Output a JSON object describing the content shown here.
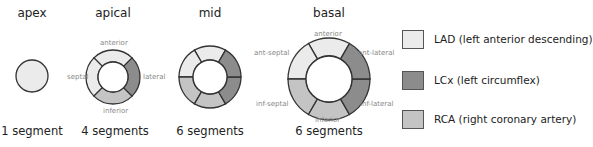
{
  "colors": {
    "LAD": "#ebebeb",
    "LCx": "#8c8c8c",
    "RCA": "#c4c4c4",
    "stroke": "#333333"
  },
  "diagrams": [
    {
      "title": "apex",
      "count": "1 segment",
      "labels": []
    },
    {
      "title": "apical",
      "count": "4 segments",
      "labels": {
        "top": "anterior",
        "left": "septal",
        "right": "lateral",
        "bottom": "inferior"
      }
    },
    {
      "title": "mid",
      "count": "6 segments",
      "labels": []
    },
    {
      "title": "basal",
      "count": "6 segments",
      "labels": {
        "top": "anterior",
        "top_left": "ant-septal",
        "top_right": "ant-lateral",
        "bottom_left": "inf-septal",
        "bottom_right": "inf-lateral",
        "bottom": "inferior"
      }
    }
  ],
  "legend": [
    {
      "key": "LAD",
      "label": "LAD (left anterior descending)"
    },
    {
      "key": "LCx",
      "label": "LCx (left circumflex)"
    },
    {
      "key": "RCA",
      "label": "RCA (right coronary artery)"
    }
  ]
}
